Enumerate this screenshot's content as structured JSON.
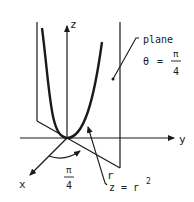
{
  "diagram": {
    "axes": {
      "x_label": "x",
      "y_label": "y",
      "z_label": "z"
    },
    "plane": {
      "label": "plane",
      "theta_symbol": "θ",
      "equals": "=",
      "theta_num": "π",
      "theta_den": "4"
    },
    "angle": {
      "num": "π",
      "den": "4"
    },
    "curve": {
      "r_label": "r",
      "eq_lhs": "z = r",
      "eq_exp": "2"
    },
    "colors": {
      "ink": "#1a1a1a",
      "background": "#ffffff"
    }
  }
}
